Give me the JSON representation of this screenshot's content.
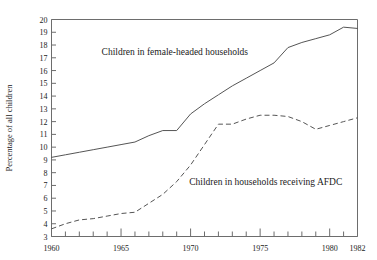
{
  "chart_data": {
    "type": "line",
    "title": "",
    "xlabel": "",
    "ylabel": "Percentage of all children",
    "xlim": [
      1960,
      1982
    ],
    "ylim": [
      3,
      20
    ],
    "grid": false,
    "legend_position": "inline-annotations",
    "y_ticks": [
      3,
      4,
      5,
      6,
      7,
      8,
      9,
      10,
      11,
      12,
      13,
      14,
      15,
      16,
      17,
      18,
      19,
      20
    ],
    "x_ticks": [
      1960,
      1961,
      1962,
      1963,
      1964,
      1965,
      1966,
      1967,
      1968,
      1969,
      1970,
      1971,
      1972,
      1973,
      1974,
      1975,
      1976,
      1977,
      1978,
      1979,
      1980,
      1981,
      1982
    ],
    "x_tick_labels": [
      "1960",
      "1965",
      "1970",
      "1975",
      "1980",
      "1982"
    ],
    "x_tick_label_years": [
      1960,
      1965,
      1970,
      1975,
      1980,
      1982
    ],
    "x": [
      1960,
      1961,
      1962,
      1963,
      1964,
      1965,
      1966,
      1967,
      1968,
      1969,
      1970,
      1971,
      1972,
      1973,
      1974,
      1975,
      1976,
      1977,
      1978,
      1979,
      1980,
      1981,
      1982
    ],
    "series": [
      {
        "name": "Children in female-headed households",
        "style": "solid",
        "color": "#555555",
        "values": [
          9.2,
          9.4,
          9.6,
          9.8,
          10.0,
          10.2,
          10.4,
          10.9,
          11.3,
          11.3,
          12.6,
          13.4,
          14.1,
          14.8,
          15.4,
          16.0,
          16.6,
          17.8,
          18.2,
          18.5,
          18.8,
          19.4,
          19.3
        ],
        "label": {
          "text": "Children in female-headed households",
          "x_year": 1963.6,
          "y_value": 17.2
        }
      },
      {
        "name": "Children in households receiving AFDC",
        "style": "dashed",
        "color": "#555555",
        "values": [
          3.6,
          4.0,
          4.3,
          4.4,
          4.6,
          4.8,
          4.9,
          5.6,
          6.3,
          7.3,
          8.6,
          10.2,
          11.8,
          11.8,
          12.2,
          12.5,
          12.5,
          12.4,
          12.0,
          11.4,
          11.7,
          12.0,
          12.3
        ],
        "label": {
          "text": "Children in households receiving AFDC",
          "x_year": 1969.9,
          "y_value": 7.0
        }
      }
    ]
  },
  "axes": {
    "y_axis_title": "Percentage of all children"
  }
}
